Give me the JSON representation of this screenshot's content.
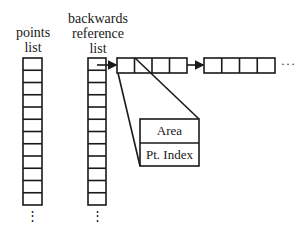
{
  "labels": {
    "points_list": [
      "points",
      "list"
    ],
    "backwards_list": [
      "backwards",
      "reference",
      "list"
    ]
  },
  "record": {
    "field1": "Area",
    "field2": "Pt. Index"
  },
  "continuation": {
    "vertical": "⋮",
    "horizontal": "···"
  },
  "structure": {
    "points_list_cells_visible": 12,
    "backwards_list_cells_visible": 12,
    "chain_blocks": 2,
    "cells_per_block": 4
  },
  "colors": {
    "stroke": "#1a1a1a",
    "background": "#ffffff"
  }
}
